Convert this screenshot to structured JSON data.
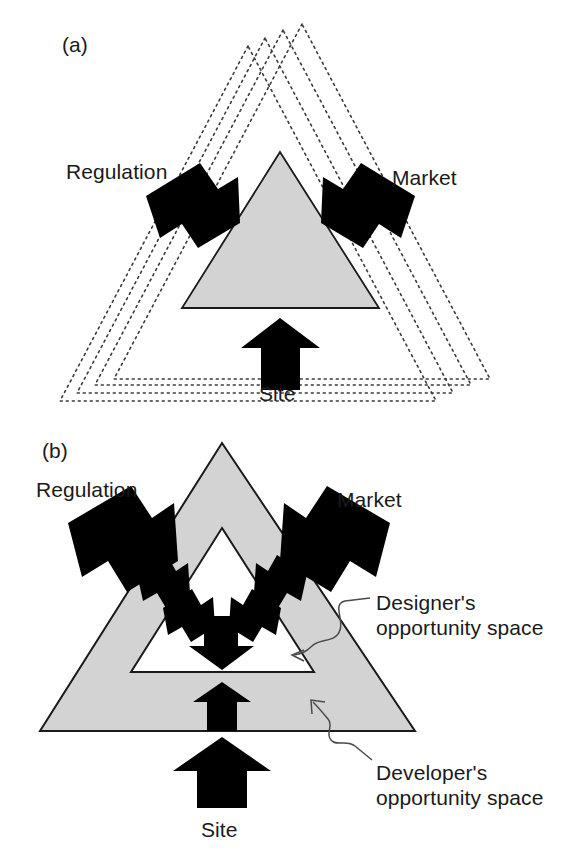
{
  "figure": {
    "panels": [
      {
        "tag": "(a)",
        "tag_name": "panel-a-tag",
        "description": "Single gray triangle with three black arrows and four nested dotted triangles",
        "labels": {
          "regulation": "Regulation",
          "market": "Market",
          "site": "Site"
        }
      },
      {
        "tag": "(b)",
        "tag_name": "panel-b-tag",
        "description": "Large gray triangle containing a smaller white triangle, with black arrows pressing inward",
        "labels": {
          "regulation": "Regulation",
          "market": "Market",
          "site": "Site",
          "designer_line1": "Designer's",
          "designer_line2": "opportunity space",
          "developer_line1": "Developer's",
          "developer_line2": "opportunity space"
        }
      }
    ]
  },
  "colors": {
    "triangle_fill": "#d3d3d3",
    "triangle_stroke": "#1a1a1a",
    "arrow_fill": "#000000",
    "dotted_line": "#3a3a3a",
    "leader_line": "#4a4a4a",
    "text": "#1a1a1a",
    "background": "#ffffff",
    "inner_triangle_fill": "#ffffff"
  },
  "geometry": {
    "panel_a": {
      "solid_triangle": {
        "apex_x": 280,
        "apex_y": 152,
        "base_y": 308,
        "base_left_x": 182,
        "base_right_x": 379
      },
      "dotted_triangle_count": 4
    },
    "panel_b": {
      "outer_triangle": {
        "apex_x": 222,
        "apex_y": 443,
        "base_y": 731,
        "base_left_x": 40,
        "base_right_x": 415
      },
      "inner_triangle": {
        "apex_x": 222,
        "apex_y": 528,
        "base_y": 672,
        "base_left_x": 131,
        "base_right_x": 314
      },
      "inner_arrow_count": 4
    }
  }
}
